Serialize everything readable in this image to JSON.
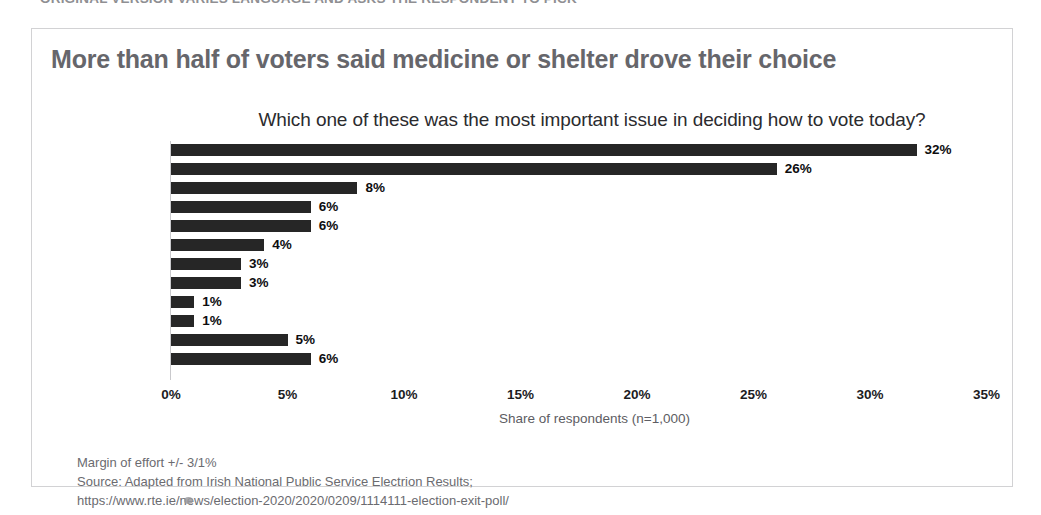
{
  "banner": {
    "clipped_text": "ORIGINAL VERSION VARIES LANGUAGE AND ASKS THE RESPONDENT TO PICK"
  },
  "slide": {
    "headline": "More than half of voters said medicine or shelter drove their choice",
    "subtitle": "Which one of these was the most important issue in deciding how to vote today?"
  },
  "footnotes": {
    "margin": "Margin of effort +/- 3/1%",
    "source": "Source: Adapted from Irish National Public Service Electrion Results;",
    "url": "https://www.rte.ie/news/election-2020/2020/0209/1114111-election-exit-poll/"
  },
  "colors": {
    "bar": "#262626",
    "headline": "#66666b",
    "frame": "#d2d2d4",
    "axis_title": "#5d5d63",
    "footnote": "#6b6b70"
  },
  "chart_data": {
    "type": "bar",
    "orientation": "horizontal",
    "title": "More than half of voters said medicine or shelter drove their choice",
    "subtitle": "Which one of these was the most important issue in deciding how to vote today?",
    "xlabel": "Share of respondents (n=1,000)",
    "ylabel": "",
    "xlim": [
      0,
      35
    ],
    "grid": false,
    "legend": false,
    "tick_labels": [
      "0%",
      "5%",
      "10%",
      "15%",
      "20%",
      "25%",
      "30%",
      "35%"
    ],
    "ticks": [
      0,
      5,
      10,
      15,
      20,
      25,
      30,
      35
    ],
    "categories": [
      "Health",
      "Housing",
      "Pension age",
      "Jobs",
      "Climate",
      "Taxes",
      "Crime",
      "Childcare",
      "Immigration",
      "Foreign affairs",
      "Not stated",
      "Something else"
    ],
    "values": [
      32,
      26,
      8,
      6,
      6,
      4,
      3,
      3,
      1,
      1,
      5,
      6
    ],
    "data_labels": [
      "32%",
      "26%",
      "8%",
      "6%",
      "6%",
      "4%",
      "3%",
      "3%",
      "1%",
      "1%",
      "5%",
      "6%"
    ]
  }
}
